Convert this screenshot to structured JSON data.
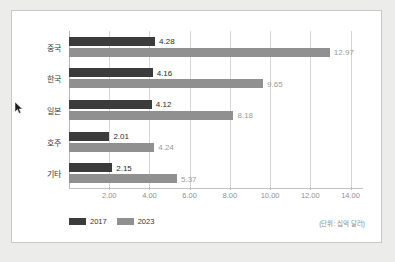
{
  "chart_data": {
    "type": "bar",
    "orientation": "horizontal",
    "title": "",
    "xlabel": "",
    "ylabel": "",
    "categories": [
      "중국",
      "한국",
      "일본",
      "호주",
      "기타"
    ],
    "series": [
      {
        "name": "2017",
        "color": "#3b3b3b",
        "values": [
          4.28,
          4.16,
          4.12,
          2.01,
          2.15
        ],
        "labels": [
          "4.28",
          "4.16",
          "4.12",
          "2.01",
          "2.15"
        ]
      },
      {
        "name": "2023",
        "color": "#909090",
        "values": [
          12.97,
          9.65,
          8.18,
          4.24,
          5.37
        ],
        "labels": [
          "12.97",
          "9.65",
          "8.18",
          "4.24",
          "5.37"
        ]
      }
    ],
    "xlim": [
      0,
      14.62
    ],
    "xticks": [
      2,
      4,
      6,
      8,
      10,
      12,
      14
    ],
    "xtick_labels": [
      "2.00",
      "4.00",
      "6.00",
      "8.00",
      "10.00",
      "12.00",
      "14.00"
    ],
    "grid": true,
    "legend_position": "bottom-left",
    "annotation": "(단위: 십억 달러)"
  },
  "legend": {
    "items": [
      {
        "label": "2017",
        "color": "#3b3b3b"
      },
      {
        "label": "2023",
        "color": "#909090"
      }
    ]
  },
  "note": {
    "unit": "(단위: 십억 달러)"
  },
  "cursor": {
    "name": "mouse-pointer"
  }
}
